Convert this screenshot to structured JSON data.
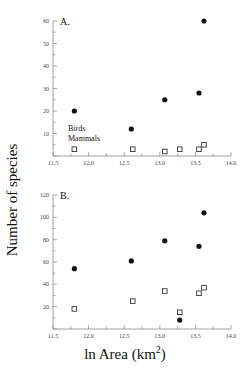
{
  "figure": {
    "ylabel": "Number of species",
    "xlabel_main": "ln Area (km",
    "xlabel_sup": "2",
    "xlabel_tail": ")"
  },
  "chart_data": [
    {
      "type": "scatter",
      "panel": "A.",
      "xlabel": "ln Area (km²)",
      "ylabel": "Number of species",
      "xlim": [
        11.5,
        14.0
      ],
      "ylim": [
        0,
        60
      ],
      "x_ticks": [
        "11.5",
        "12.0",
        "12.5",
        "13.0",
        "13.5",
        "14.0"
      ],
      "y_ticks": [
        "10",
        "20",
        "30",
        "40",
        "50",
        "60"
      ],
      "annotations": [
        "Birds",
        "Mammals"
      ],
      "series": [
        {
          "name": "Birds",
          "marker": "filled-circle",
          "points": [
            [
              11.8,
              20
            ],
            [
              12.6,
              12
            ],
            [
              13.07,
              25
            ],
            [
              13.55,
              28
            ],
            [
              13.62,
              60
            ]
          ]
        },
        {
          "name": "Mammals",
          "marker": "open-square",
          "points": [
            [
              11.8,
              3
            ],
            [
              12.62,
              3
            ],
            [
              13.07,
              2
            ],
            [
              13.28,
              3
            ],
            [
              13.55,
              3
            ],
            [
              13.62,
              5
            ]
          ]
        }
      ]
    },
    {
      "type": "scatter",
      "panel": "B.",
      "xlabel": "ln Area (km²)",
      "ylabel": "Number of species",
      "xlim": [
        11.5,
        14.0
      ],
      "ylim": [
        0,
        120
      ],
      "x_ticks": [
        "11.5",
        "12.0",
        "12.5",
        "13.0",
        "13.5",
        "14.0"
      ],
      "y_ticks": [
        "20",
        "40",
        "60",
        "80",
        "100",
        "120"
      ],
      "series": [
        {
          "name": "Birds",
          "marker": "filled-circle",
          "points": [
            [
              11.8,
              54
            ],
            [
              12.6,
              61
            ],
            [
              13.07,
              79
            ],
            [
              13.28,
              8
            ],
            [
              13.55,
              74
            ],
            [
              13.62,
              104
            ]
          ]
        },
        {
          "name": "Mammals",
          "marker": "open-square",
          "points": [
            [
              11.8,
              18
            ],
            [
              12.62,
              25
            ],
            [
              13.07,
              34
            ],
            [
              13.28,
              15
            ],
            [
              13.55,
              32
            ],
            [
              13.62,
              37
            ]
          ]
        }
      ]
    }
  ]
}
